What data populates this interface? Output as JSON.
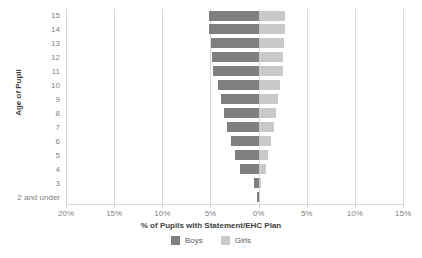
{
  "chart_data": {
    "type": "bar",
    "orientation": "horizontal",
    "style": "diverging-tornado",
    "title": "",
    "xlabel": "% of Pupils with Statement/EHC Plan",
    "ylabel": "Age of Pupil",
    "categories": [
      "15",
      "14",
      "13",
      "12",
      "11",
      "10",
      "9",
      "8",
      "7",
      "6",
      "5",
      "4",
      "3",
      "2 and under"
    ],
    "series": [
      {
        "name": "Boys",
        "color": "#7f7f7f",
        "direction": "left",
        "values": [
          5.2,
          5.1,
          4.9,
          4.8,
          4.7,
          4.2,
          3.9,
          3.6,
          3.3,
          2.9,
          2.4,
          1.9,
          0.5,
          0.15
        ]
      },
      {
        "name": "Girls",
        "color": "#c9c9c9",
        "direction": "right",
        "values": [
          2.7,
          2.7,
          2.6,
          2.5,
          2.5,
          2.2,
          2.0,
          1.8,
          1.6,
          1.3,
          1.0,
          0.8,
          0.25,
          0.1
        ]
      }
    ],
    "xticks": [
      {
        "label": "20%",
        "value": -20
      },
      {
        "label": "15%",
        "value": -15
      },
      {
        "label": "10%",
        "value": -10
      },
      {
        "label": "5%",
        "value": -5
      },
      {
        "label": "0%",
        "value": 0
      },
      {
        "label": "5%",
        "value": 5
      },
      {
        "label": "10%",
        "value": 10
      },
      {
        "label": "15%",
        "value": 15
      }
    ],
    "xlim": [
      -20,
      15
    ],
    "grid": true,
    "legend_position": "bottom"
  },
  "legend": {
    "boys_label": "Boys",
    "girls_label": "Girls"
  },
  "axes": {
    "y_title": "Age of Pupil",
    "x_title": "% of Pupils with Statement/EHC Plan"
  }
}
